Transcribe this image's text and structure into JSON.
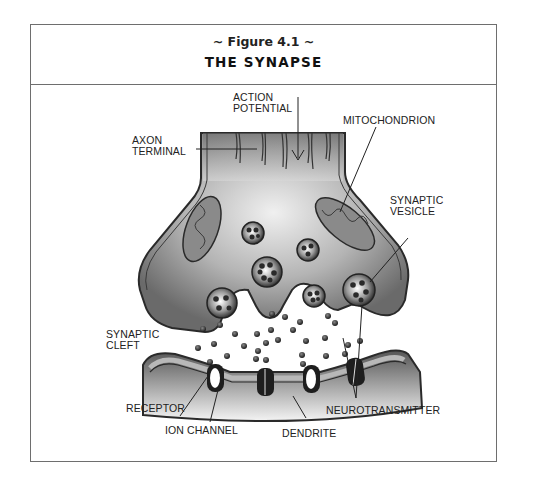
{
  "figure": {
    "number": "~ Figure 4.1 ~",
    "title": "THE SYNAPSE"
  },
  "labels": {
    "action_potential": [
      "ACTION",
      "POTENTIAL"
    ],
    "axon_terminal": [
      "AXON",
      "TERMINAL"
    ],
    "mitochondrion": "MITOCHONDRION",
    "synaptic_vesicle": [
      "SYNAPTIC",
      "VESICLE"
    ],
    "synaptic_cleft": [
      "SYNAPTIC",
      "CLEFT"
    ],
    "receptor": "RECEPTOR",
    "ion_channel": "ION CHANNEL",
    "dendrite": "DENDRITE",
    "neurotransmitter": "NEUROTRANSMITTER"
  },
  "colors": {
    "membrane_dark": "#3a3a3a",
    "cytoplasm_dark": "#6a6a6a",
    "cytoplasm_light": "#e8e8e8",
    "frame": "#6e6e6e"
  }
}
